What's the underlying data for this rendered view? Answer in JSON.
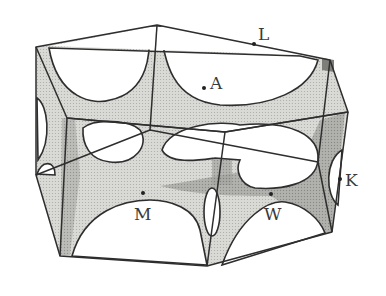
{
  "figure": {
    "type": "Fermi surface in hexagonal Brillouin zone",
    "colors": {
      "background": "#ffffff",
      "surface_light": "#d6d6d2",
      "surface_mid": "#b8b8b4",
      "surface_dark": "#8c8c88",
      "edge": "#2e2e2e",
      "label": "#3a3a3a"
    }
  },
  "points": [
    {
      "label": "L",
      "x": 254,
      "y": 44,
      "lx": 258,
      "ly": 40
    },
    {
      "label": "A",
      "x": 204,
      "y": 88,
      "lx": 210,
      "ly": 89
    },
    {
      "label": "M",
      "x": 143,
      "y": 193,
      "lx": 134,
      "ly": 220
    },
    {
      "label": "W",
      "x": 271,
      "y": 194,
      "lx": 264,
      "ly": 220
    },
    {
      "label": "K",
      "x": 340,
      "y": 179,
      "lx": 345,
      "ly": 186
    }
  ]
}
